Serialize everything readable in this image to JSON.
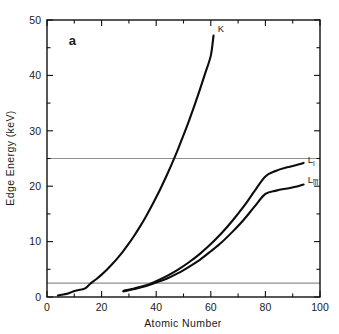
{
  "figure": {
    "panel_label": "a",
    "background_color": "#ffffff",
    "curve_color": "#0d0d0d",
    "reference_line_color": "#8f8f8f",
    "axis_color": "#111111"
  },
  "chart_data": {
    "type": "line",
    "title": "",
    "subtitle": "",
    "panel": "a",
    "xlabel": "Atomic  Number",
    "ylabel": "Edge Energy (keV)",
    "xlim": [
      0,
      100
    ],
    "ylim": [
      0,
      50
    ],
    "grid": false,
    "legend_position": "inline-right",
    "x_major_ticks": [
      0,
      20,
      40,
      60,
      80,
      100
    ],
    "x_major_tick_labels": [
      "0",
      "20",
      "40",
      "60",
      "80",
      "100"
    ],
    "x_minor_ticks": [
      10,
      30,
      50,
      70,
      90
    ],
    "y_major_ticks": [
      0,
      10,
      20,
      30,
      40,
      50
    ],
    "y_major_tick_labels": [
      "0",
      "10",
      "20",
      "30",
      "40",
      "50"
    ],
    "y_minor_ticks": [
      5,
      15,
      25,
      35,
      45
    ],
    "annotations": [
      {
        "name": "panel-label",
        "text": "a",
        "x": 8,
        "y": 45.5
      },
      {
        "name": "k-edge-label",
        "text": "K",
        "x": 62.5,
        "y": 47.8
      },
      {
        "name": "l1-edge-label",
        "text": "L",
        "subscript": "I",
        "x": 95.5,
        "y": 24.2
      },
      {
        "name": "l3-edge-label",
        "text": "L",
        "subscript": "III",
        "x": 95.5,
        "y": 20.6
      }
    ],
    "reference_lines": [
      {
        "name": "upper-reference-line",
        "orientation": "horizontal",
        "y": 25.0,
        "color": "#8f8f8f"
      },
      {
        "name": "lower-reference-line",
        "orientation": "horizontal",
        "y": 2.5,
        "color": "#8f8f8f"
      }
    ],
    "series": [
      {
        "name": "K",
        "label": "K",
        "x": [
          4,
          6,
          8,
          10,
          12,
          14,
          16,
          18,
          20,
          22,
          24,
          26,
          28,
          30,
          32,
          34,
          36,
          38,
          40,
          42,
          44,
          46,
          48,
          50,
          52,
          54,
          56,
          58,
          60,
          61
        ],
        "values": [
          0.28,
          0.45,
          0.69,
          1.07,
          1.3,
          1.56,
          2.47,
          3.2,
          4.04,
          4.97,
          5.99,
          7.11,
          8.33,
          9.66,
          11.1,
          12.66,
          14.32,
          16.1,
          17.99,
          20.0,
          22.12,
          24.35,
          26.71,
          29.2,
          31.81,
          34.56,
          37.44,
          40.45,
          43.57,
          47.2
        ]
      },
      {
        "name": "L-I",
        "label": "L",
        "sublabel": "I",
        "x": [
          28,
          32,
          36,
          40,
          44,
          48,
          52,
          56,
          60,
          64,
          68,
          72,
          76,
          80,
          84,
          88,
          92,
          94
        ],
        "values": [
          1.1,
          1.55,
          2.07,
          2.87,
          3.81,
          4.94,
          6.27,
          7.79,
          9.56,
          11.55,
          13.81,
          16.3,
          19.1,
          21.76,
          22.8,
          23.4,
          23.9,
          24.2
        ]
      },
      {
        "name": "L-III",
        "label": "L",
        "sublabel": "III",
        "x": [
          28,
          32,
          36,
          40,
          44,
          48,
          52,
          56,
          60,
          64,
          68,
          72,
          76,
          80,
          84,
          88,
          92,
          94
        ],
        "values": [
          1.02,
          1.43,
          1.92,
          2.63,
          3.35,
          4.3,
          5.45,
          6.72,
          8.25,
          9.88,
          11.8,
          13.9,
          16.3,
          18.6,
          19.2,
          19.6,
          20.0,
          20.3
        ]
      }
    ]
  }
}
